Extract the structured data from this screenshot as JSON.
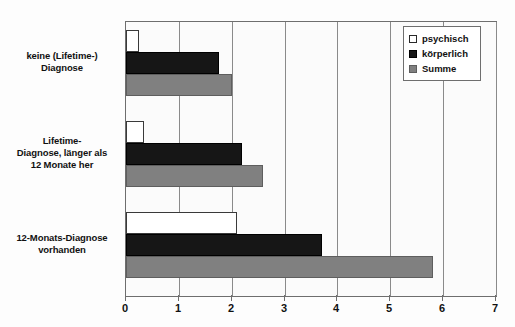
{
  "chart_data": {
    "type": "bar",
    "orientation": "horizontal",
    "title": "",
    "subtitle": "",
    "xlabel": "",
    "ylabel": "",
    "xlim": [
      0,
      7
    ],
    "xticks": [
      "0",
      "1",
      "2",
      "3",
      "4",
      "5",
      "6",
      "7"
    ],
    "grid": true,
    "grid_axis": "x",
    "legend_position": "top-right",
    "categories": [
      "keine (Lifetime-) Diagnose",
      "Lifetime-Diagnose, länger als 12 Monate her",
      "12-Monats-Diagnose vorhanden"
    ],
    "category_lines": [
      [
        "keine (Lifetime-)",
        "Diagnose"
      ],
      [
        "Lifetime-",
        "Diagnose, länger als",
        "12 Monate her"
      ],
      [
        "12-Monats-Diagnose",
        "vorhanden"
      ]
    ],
    "series": [
      {
        "name": "psychisch",
        "color": "#ffffff",
        "values": [
          0.25,
          0.35,
          2.1
        ]
      },
      {
        "name": "körperlich",
        "color": "#161616",
        "values": [
          1.75,
          2.2,
          3.7
        ]
      },
      {
        "name": "Summe",
        "color": "#808080",
        "values": [
          2.0,
          2.6,
          5.8
        ]
      }
    ]
  },
  "legend": {
    "items": [
      {
        "label": "psychisch",
        "swatch": "psychisch"
      },
      {
        "label": "körperlich",
        "swatch": "koerperlich"
      },
      {
        "label": "Summe",
        "swatch": "summe"
      }
    ]
  },
  "axis": {
    "x_tick_labels": [
      "0",
      "1",
      "2",
      "3",
      "4",
      "5",
      "6",
      "7"
    ]
  },
  "colors": {
    "psychisch": "#ffffff",
    "koerperlich": "#161616",
    "summe": "#808080",
    "frame": "#6e6e6e",
    "grid": "#8a8a8a",
    "text": "#111111"
  }
}
